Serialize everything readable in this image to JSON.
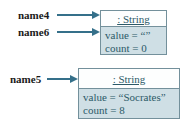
{
  "references": [
    {
      "label": "name4"
    },
    {
      "label": "name6"
    },
    {
      "label": "name5"
    }
  ],
  "objects": [
    {
      "header": ": String",
      "fields": [
        "value = “”",
        "count = 0"
      ]
    },
    {
      "header": ": String",
      "fields": [
        "value = “Socrates”",
        "count = 8"
      ]
    }
  ],
  "colors": {
    "arrow": "#35708a",
    "box_border": "#73909b",
    "header_fill": "#fdfefe",
    "body_fill": "#cfdfe5",
    "box_text": "#2c5a68",
    "label_text": "#1a1a1a"
  }
}
